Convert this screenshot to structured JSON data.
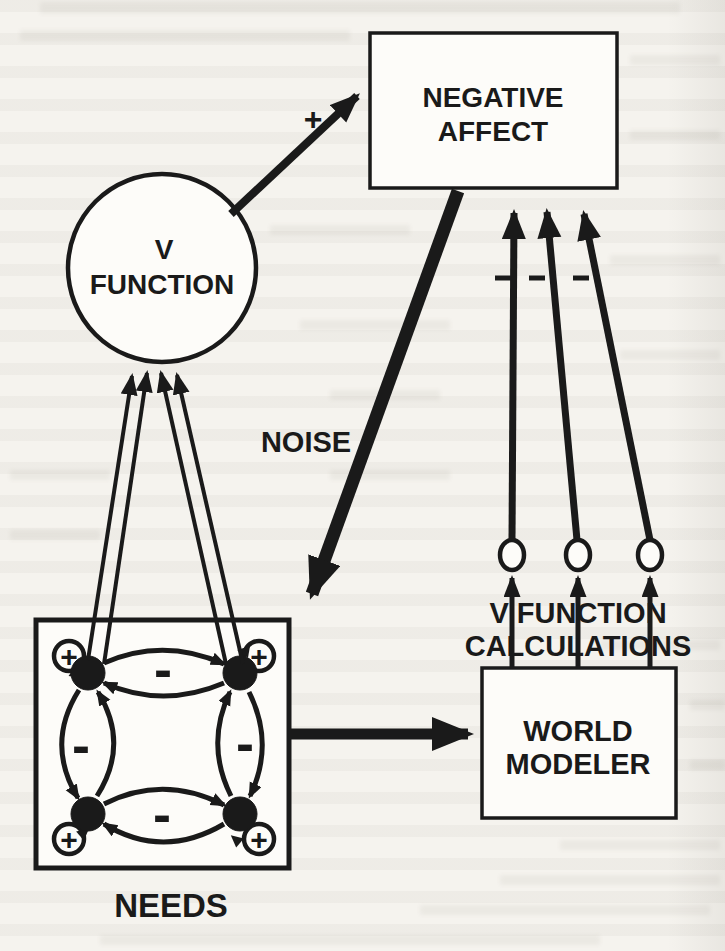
{
  "figure": {
    "boxes": {
      "negative_affect": {
        "line1": "NEGATIVE",
        "line2": "AFFECT"
      },
      "world_modeler": {
        "line1": "WORLD",
        "line2": "MODELER"
      },
      "needs": {
        "label": "NEEDS"
      }
    },
    "circle": {
      "line1": "V",
      "line2": "FUNCTION"
    },
    "labels": {
      "noise": "NOISE",
      "v_function_calculations_line1": "V FUNCTION",
      "v_function_calculations_line2": "CALCULATIONS",
      "plus": "+",
      "minus": "-"
    },
    "colors": {
      "ink": "#1a1a1a",
      "paper": "#f5f3ee"
    }
  }
}
